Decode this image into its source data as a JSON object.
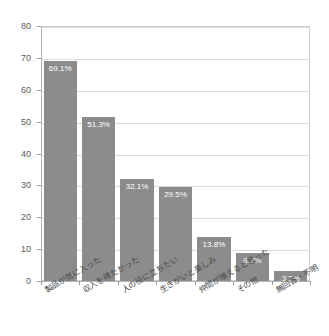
{
  "chart_data": {
    "type": "bar",
    "title": "",
    "subtitle": "",
    "xlabel": "",
    "ylabel": "",
    "ylim": [
      0,
      80
    ],
    "y_ticks": [
      0,
      10,
      20,
      30,
      40,
      50,
      60,
      70,
      80
    ],
    "y_tick_labels": [
      "0",
      "10",
      "20",
      "30",
      "40",
      "50",
      "60",
      "70",
      "80"
    ],
    "grid": true,
    "legend": "none",
    "bar_color": "#8c8c8c",
    "categories": [
      "製品が気に入った",
      "収入を得たかった",
      "人の役に立ちたい",
      "生きがいと楽しみ",
      "仲間が増えると思った",
      "その他",
      "無回答・不明"
    ],
    "values": [
      69.1,
      51.3,
      32.1,
      29.5,
      13.8,
      8.7,
      3.2
    ],
    "data_labels": [
      "69.1%",
      "51.3%",
      "32.1%",
      "29.5%",
      "13.8%",
      "8.7%",
      "3.2%"
    ]
  },
  "colors": {
    "bar": "#8c8c8c",
    "grid": "#dcdcdc",
    "axis": "#b4b4b4",
    "tick_text": "#5a5a5a",
    "category_text": "#4a4a4a",
    "value_text": "#ffffff",
    "background": "#ffffff"
  }
}
